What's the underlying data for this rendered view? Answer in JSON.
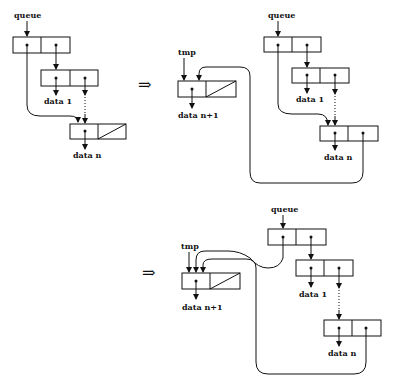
{
  "diagram": {
    "implies_symbol": "⇒",
    "panel1": {
      "labels": {
        "queue": "queue",
        "data1": "data 1",
        "datan": "data n"
      }
    },
    "panel2": {
      "labels": {
        "tmp": "tmp",
        "datan1": "data n+1",
        "queue": "queue",
        "data1": "data 1",
        "datan": "data n"
      }
    },
    "panel3": {
      "labels": {
        "tmp": "tmp",
        "datan1": "data n+1",
        "queue": "queue",
        "data1": "data 1",
        "datan": "data n"
      }
    }
  }
}
